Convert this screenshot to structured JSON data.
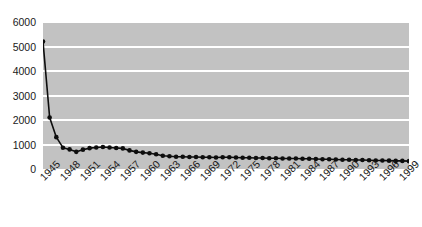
{
  "chart_data": {
    "type": "line",
    "title": "",
    "xlabel": "",
    "ylabel": "",
    "ylim": [
      0,
      6000
    ],
    "xlim": [
      1945,
      2000
    ],
    "grid": true,
    "legend": false,
    "y_ticks": [
      0,
      1000,
      2000,
      3000,
      4000,
      5000,
      6000
    ],
    "y_tick_labels": [
      "0",
      "1000",
      "2000",
      "3000",
      "4000",
      "5000",
      "6000"
    ],
    "x_tick_labels": [
      "1945",
      "1948",
      "1951",
      "1954",
      "1957",
      "1960",
      "1963",
      "1966",
      "1969",
      "1972",
      "1975",
      "1978",
      "1981",
      "1984",
      "1987",
      "1990",
      "1993",
      "1996",
      "1999"
    ],
    "x_tick_values": [
      1945,
      1948,
      1951,
      1954,
      1957,
      1960,
      1963,
      1966,
      1969,
      1972,
      1975,
      1978,
      1981,
      1984,
      1987,
      1990,
      1993,
      1996,
      1999
    ],
    "x": [
      1945,
      1946,
      1947,
      1948,
      1949,
      1950,
      1951,
      1952,
      1953,
      1954,
      1955,
      1956,
      1957,
      1958,
      1959,
      1960,
      1961,
      1962,
      1963,
      1964,
      1965,
      1966,
      1967,
      1968,
      1969,
      1970,
      1971,
      1972,
      1973,
      1974,
      1975,
      1976,
      1977,
      1978,
      1979,
      1980,
      1981,
      1982,
      1983,
      1984,
      1985,
      1986,
      1987,
      1988,
      1989,
      1990,
      1991,
      1992,
      1993,
      1994,
      1995,
      1996,
      1997,
      1998,
      1999,
      2000
    ],
    "values": [
      5200,
      2100,
      1300,
      870,
      800,
      700,
      790,
      850,
      880,
      900,
      880,
      860,
      840,
      760,
      700,
      670,
      640,
      600,
      540,
      520,
      500,
      500,
      490,
      490,
      480,
      480,
      470,
      480,
      480,
      470,
      460,
      460,
      450,
      450,
      440,
      440,
      430,
      430,
      430,
      420,
      420,
      410,
      400,
      400,
      390,
      380,
      380,
      370,
      370,
      360,
      350,
      350,
      340,
      330,
      330,
      320
    ],
    "series_color": "#0d0d0d",
    "plot_background": "#c2c2c2",
    "gridline_color": "#ffffff",
    "marker": "circle"
  }
}
